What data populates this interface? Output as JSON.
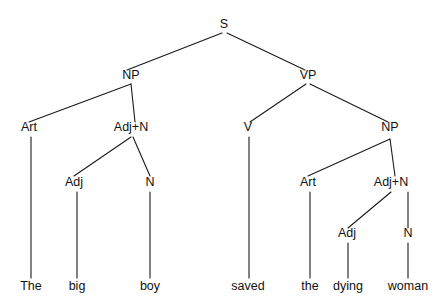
{
  "figure": {
    "kind": "syntax-tree",
    "sentence": "The big boy saved the dying woman",
    "background_color": "#ffffff",
    "line_color": "#1a1a1a",
    "text_color": "#111111",
    "width": 448,
    "height": 308
  },
  "nodes": [
    {
      "id": "S",
      "label": "S",
      "x": 224,
      "y": 28,
      "level": 0
    },
    {
      "id": "NP1",
      "label": "NP",
      "x": 131,
      "y": 79,
      "level": 1
    },
    {
      "id": "VP",
      "label": "VP",
      "x": 308,
      "y": 79,
      "level": 1
    },
    {
      "id": "Art1",
      "label": "Art",
      "x": 29,
      "y": 131,
      "level": 2
    },
    {
      "id": "AdjN1",
      "label": "Adj+N",
      "x": 131,
      "y": 131,
      "level": 2
    },
    {
      "id": "V",
      "label": "V",
      "x": 248,
      "y": 131,
      "level": 2
    },
    {
      "id": "NP2",
      "label": "NP",
      "x": 390,
      "y": 131,
      "level": 2
    },
    {
      "id": "Adj1",
      "label": "Adj",
      "x": 74,
      "y": 186,
      "level": 3
    },
    {
      "id": "N1",
      "label": "N",
      "x": 150,
      "y": 186,
      "level": 3
    },
    {
      "id": "Art2",
      "label": "Art",
      "x": 308,
      "y": 186,
      "level": 3
    },
    {
      "id": "AdjN2",
      "label": "Adj+N",
      "x": 391,
      "y": 186,
      "level": 3
    },
    {
      "id": "Adj2",
      "label": "Adj",
      "x": 347,
      "y": 237,
      "level": 4
    },
    {
      "id": "N2",
      "label": "N",
      "x": 408,
      "y": 237,
      "level": 4
    }
  ],
  "leaves": [
    {
      "id": "w1",
      "label": "The",
      "x": 31,
      "y": 290,
      "parent": "Art1"
    },
    {
      "id": "w2",
      "label": "big",
      "x": 77,
      "y": 290,
      "parent": "Adj1"
    },
    {
      "id": "w3",
      "label": "boy",
      "x": 150,
      "y": 290,
      "parent": "N1"
    },
    {
      "id": "w4",
      "label": "saved",
      "x": 248,
      "y": 290,
      "parent": "V"
    },
    {
      "id": "w5",
      "label": "the",
      "x": 310,
      "y": 290,
      "parent": "Art2"
    },
    {
      "id": "w6",
      "label": "dying",
      "x": 348,
      "y": 290,
      "parent": "Adj2"
    },
    {
      "id": "w7",
      "label": "woman",
      "x": 408,
      "y": 290,
      "parent": "N2"
    }
  ],
  "edges": [
    {
      "from": "S",
      "to": "NP1",
      "x1": 222,
      "y1": 33,
      "x2": 127,
      "y2": 70
    },
    {
      "from": "S",
      "to": "VP",
      "x1": 227,
      "y1": 33,
      "x2": 305,
      "y2": 70
    },
    {
      "from": "NP1",
      "to": "Art1",
      "x1": 131,
      "y1": 84,
      "x2": 29,
      "y2": 122
    },
    {
      "from": "NP1",
      "to": "AdjN1",
      "x1": 131,
      "y1": 84,
      "x2": 135,
      "y2": 122
    },
    {
      "from": "VP",
      "to": "V",
      "x1": 306,
      "y1": 84,
      "x2": 250,
      "y2": 122
    },
    {
      "from": "VP",
      "to": "NP2",
      "x1": 310,
      "y1": 84,
      "x2": 388,
      "y2": 122
    },
    {
      "from": "Art1",
      "to": "w1",
      "x1": 31,
      "y1": 137,
      "x2": 31,
      "y2": 278
    },
    {
      "from": "AdjN1",
      "to": "Adj1",
      "x1": 131,
      "y1": 137,
      "x2": 74,
      "y2": 176
    },
    {
      "from": "AdjN1",
      "to": "N1",
      "x1": 133,
      "y1": 137,
      "x2": 150,
      "y2": 176
    },
    {
      "from": "Adj1",
      "to": "w2",
      "x1": 77,
      "y1": 192,
      "x2": 77,
      "y2": 278
    },
    {
      "from": "N1",
      "to": "w3",
      "x1": 150,
      "y1": 192,
      "x2": 150,
      "y2": 278
    },
    {
      "from": "V",
      "to": "w4",
      "x1": 249,
      "y1": 137,
      "x2": 249,
      "y2": 278
    },
    {
      "from": "NP2",
      "to": "Art2",
      "x1": 390,
      "y1": 139,
      "x2": 308,
      "y2": 176
    },
    {
      "from": "NP2",
      "to": "AdjN2",
      "x1": 390,
      "y1": 139,
      "x2": 395,
      "y2": 176
    },
    {
      "from": "Art2",
      "to": "w5",
      "x1": 310,
      "y1": 192,
      "x2": 310,
      "y2": 278
    },
    {
      "from": "AdjN2",
      "to": "Adj2",
      "x1": 391,
      "y1": 192,
      "x2": 348,
      "y2": 228
    },
    {
      "from": "AdjN2",
      "to": "N2",
      "x1": 408,
      "y1": 192,
      "x2": 408,
      "y2": 228
    },
    {
      "from": "Adj2",
      "to": "w6",
      "x1": 348,
      "y1": 243,
      "x2": 348,
      "y2": 278
    },
    {
      "from": "N2",
      "to": "w7",
      "x1": 408,
      "y1": 243,
      "x2": 408,
      "y2": 278
    }
  ]
}
